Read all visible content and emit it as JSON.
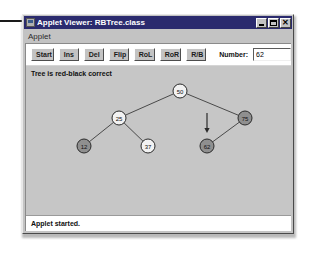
{
  "window": {
    "title": "Applet Viewer: RBTree.class",
    "icon": "applet-icon",
    "controls": {
      "minimize": "minimize-icon",
      "maximize": "maximize-icon",
      "close": "close-icon",
      "close_glyph": "✕"
    }
  },
  "menu": {
    "items": [
      {
        "label": "Applet"
      }
    ]
  },
  "toolbar": {
    "buttons": [
      {
        "label": "Start",
        "name": "start-button"
      },
      {
        "label": "Ins",
        "name": "ins-button"
      },
      {
        "label": "Del",
        "name": "del-button"
      },
      {
        "label": "Flip",
        "name": "flip-button"
      },
      {
        "label": "RoL",
        "name": "rol-button"
      },
      {
        "label": "RoR",
        "name": "ror-button"
      },
      {
        "label": "R/B",
        "name": "rb-button"
      }
    ],
    "number_label": "Number:",
    "number_value": "62",
    "number_placeholder": ""
  },
  "canvas": {
    "tree_status": "Tree is red-black correct",
    "colors": {
      "black_node_fill": "#f2f2f2",
      "red_node_fill": "#8f8f8f",
      "node_stroke": "#2a2a2a",
      "edge_stroke": "#3b3b3b",
      "arrow": "#2a2a2a",
      "background": "#c6c6c6"
    },
    "tree": {
      "nodes": [
        {
          "id": "n50",
          "value": "50",
          "color": "black",
          "x": 154,
          "y": 25
        },
        {
          "id": "n25",
          "value": "25",
          "color": "black",
          "x": 93,
          "y": 52
        },
        {
          "id": "n75",
          "value": "75",
          "color": "red",
          "x": 219,
          "y": 52
        },
        {
          "id": "n12",
          "value": "12",
          "color": "red",
          "x": 58,
          "y": 80
        },
        {
          "id": "n37",
          "value": "37",
          "color": "black",
          "x": 122,
          "y": 80
        },
        {
          "id": "n62",
          "value": "62",
          "color": "red",
          "x": 181,
          "y": 80
        }
      ],
      "edges": [
        {
          "from": "n50",
          "to": "n25"
        },
        {
          "from": "n50",
          "to": "n75"
        },
        {
          "from": "n25",
          "to": "n12"
        },
        {
          "from": "n25",
          "to": "n37"
        },
        {
          "from": "n75",
          "to": "n62"
        }
      ],
      "pointer": {
        "target": "n62",
        "x": 181,
        "y": 61,
        "label": "insert-pointer-arrow"
      }
    }
  },
  "status": {
    "text": "Applet started."
  }
}
